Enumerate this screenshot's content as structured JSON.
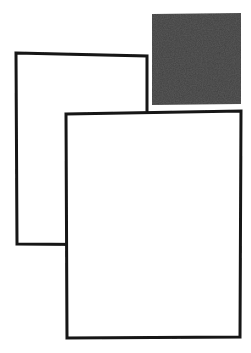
{
  "canvas": {
    "width": 251,
    "height": 353,
    "background_color": "#ffffff",
    "ink_color": "#101010",
    "title": "Three overlapping squares",
    "media": "scanned line drawing"
  },
  "figure": {
    "shape_count": 3,
    "stroke_color": "#141414",
    "fill_color": "#ffffff",
    "solid_fill_color": "#1a1a1a"
  },
  "shapes": [
    {
      "id": "square-filled-top-right",
      "name": "filled-black-square",
      "style": "solid",
      "fill": "#1a1a1a",
      "stroke": "none",
      "z_order": 1,
      "points": "152,14 241,13 241,104 152,105",
      "bbox": {
        "x": 152,
        "y": 13,
        "width": 89,
        "height": 92
      }
    },
    {
      "id": "square-outline-back-left",
      "name": "back-outlined-square",
      "style": "outline",
      "fill": "#ffffff",
      "stroke": "#141414",
      "stroke_width": 3,
      "z_order": 2,
      "points": "16,53 147,56 147,245 17,244",
      "bbox": {
        "x": 16,
        "y": 53,
        "width": 131,
        "height": 192
      }
    },
    {
      "id": "square-outline-front-large",
      "name": "front-outlined-square",
      "style": "outline",
      "fill": "#ffffff",
      "stroke": "#141414",
      "stroke_width": 3,
      "z_order": 3,
      "points": "66,114 241,111 240,337 67,338",
      "bbox": {
        "x": 66,
        "y": 111,
        "width": 175,
        "height": 227
      }
    }
  ],
  "occlusions": [
    {
      "occluder": "front-outlined-square",
      "occluded": "back-outlined-square",
      "note": "front square hides the lower-right portion of the back square"
    },
    {
      "occluder": "front-outlined-square",
      "occluded": "filled-black-square",
      "note": "front square top edge crosses below the filled black square"
    }
  ]
}
